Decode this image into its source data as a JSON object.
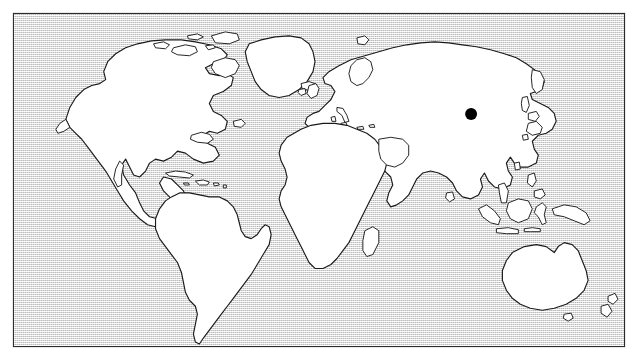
{
  "figure": {
    "kind": "world-map-locator",
    "caption": ""
  },
  "frame": {
    "border_color": "#2b2b2b",
    "border_width_px": 1.4,
    "x": 13,
    "y": 13,
    "width": 612,
    "height": 334,
    "outer_background": "#ffffff"
  },
  "map": {
    "projection": "cylindrical",
    "ocean_fill": "#dcdcdc",
    "ocean_style": "stippled-dither",
    "land_fill": "#ffffff",
    "land_outline": "#1a1a1a",
    "land_outline_width_px": 1.15,
    "antarctica_shown": false,
    "graticule_shown": false,
    "labels_shown": false,
    "lon_range": [
      -180,
      180
    ],
    "lat_range": [
      -60,
      84
    ]
  },
  "markers": [
    {
      "name": "location-marker",
      "shape": "filled-circle",
      "color": "#000000",
      "radius_px": 6,
      "x_px": 473,
      "y_px": 115,
      "lon": 105,
      "lat": 35,
      "region": "eastern-asia",
      "label": ""
    }
  ],
  "legend": {
    "shown": false,
    "entries": []
  },
  "landmasses": [
    {
      "name": "north-america"
    },
    {
      "name": "south-america"
    },
    {
      "name": "greenland"
    },
    {
      "name": "eurasia"
    },
    {
      "name": "africa"
    },
    {
      "name": "australia"
    },
    {
      "name": "madagascar"
    },
    {
      "name": "japan"
    },
    {
      "name": "new-zealand"
    },
    {
      "name": "indonesia"
    },
    {
      "name": "philippines"
    },
    {
      "name": "new-guinea"
    },
    {
      "name": "british-isles"
    },
    {
      "name": "iceland"
    },
    {
      "name": "caribbean-islands"
    },
    {
      "name": "canadian-arctic-islands"
    },
    {
      "name": "sri-lanka"
    },
    {
      "name": "taiwan"
    },
    {
      "name": "svalbard"
    }
  ]
}
